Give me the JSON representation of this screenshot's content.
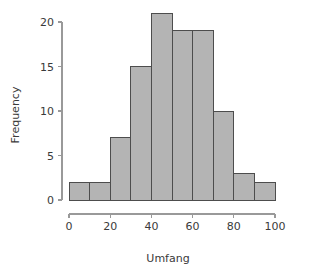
{
  "chart_data": {
    "type": "bar",
    "title": "",
    "subtitle": "",
    "xlabel": "Umfang",
    "ylabel": "Frequency",
    "categories": [
      "0-10",
      "10-20",
      "20-30",
      "30-40",
      "40-50",
      "50-60",
      "60-70",
      "70-80",
      "80-90",
      "90-100"
    ],
    "bin_edges": [
      0,
      10,
      20,
      30,
      40,
      50,
      60,
      70,
      80,
      90,
      100
    ],
    "values": [
      2,
      2,
      7,
      15,
      21,
      19,
      19,
      10,
      3,
      2
    ],
    "xlim": [
      0,
      100
    ],
    "ylim": [
      0,
      21
    ],
    "xticks": [
      0,
      20,
      40,
      60,
      80,
      100
    ],
    "yticks": [
      0,
      5,
      10,
      15,
      20
    ],
    "xtick_labels": [
      "0",
      "20",
      "40",
      "60",
      "80",
      "100"
    ],
    "ytick_labels": [
      "0",
      "5",
      "10",
      "15",
      "20"
    ],
    "grid": false,
    "legend": false,
    "legend_position": "none",
    "bar_fill_color": "#b4b4b4",
    "bar_border_color": "#4d4d4d",
    "axis_color": "#999999",
    "text_color": "#3a3a3a",
    "background_color": "#ffffff"
  }
}
